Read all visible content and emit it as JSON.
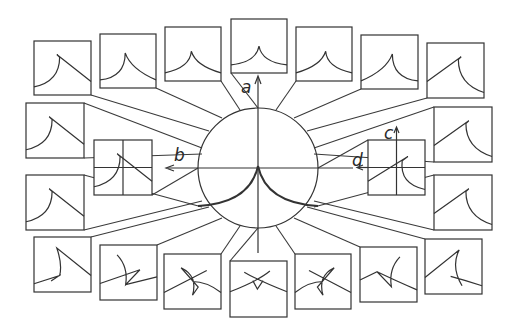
{
  "figure": {
    "stroke_color": "#333333",
    "background": "#ffffff"
  },
  "axes": {
    "a": "a",
    "b": "b",
    "c": "c",
    "d": "d"
  },
  "boxes": [
    {
      "id": "top-1",
      "x": 34,
      "y": 41,
      "w": 57,
      "h": 54,
      "curve": "cusp-left",
      "anchor": [
        209,
        131
      ]
    },
    {
      "id": "top-2",
      "x": 100,
      "y": 34,
      "w": 56,
      "h": 54,
      "curve": "cusp-left-mild",
      "anchor": [
        222,
        118
      ]
    },
    {
      "id": "top-3",
      "x": 165,
      "y": 27,
      "w": 56,
      "h": 54,
      "curve": "cusp-sym-left",
      "anchor": [
        240,
        110
      ]
    },
    {
      "id": "top-4",
      "x": 231,
      "y": 19,
      "w": 56,
      "h": 54,
      "curve": "cusp-sym",
      "anchor": [
        258,
        108
      ]
    },
    {
      "id": "top-5",
      "x": 296,
      "y": 27,
      "w": 56,
      "h": 54,
      "curve": "cusp-sym-right",
      "anchor": [
        276,
        110
      ]
    },
    {
      "id": "top-6",
      "x": 361,
      "y": 35,
      "w": 57,
      "h": 54,
      "curve": "cusp-right-mild",
      "anchor": [
        294,
        118
      ]
    },
    {
      "id": "top-7",
      "x": 427,
      "y": 43,
      "w": 57,
      "h": 55,
      "curve": "cusp-right",
      "anchor": [
        307,
        131
      ]
    },
    {
      "id": "left-upper",
      "x": 26,
      "y": 103,
      "w": 58,
      "h": 55,
      "curve": "cusp-left",
      "anchor": [
        202,
        148
      ]
    },
    {
      "id": "left-lower",
      "x": 26,
      "y": 175,
      "w": 58,
      "h": 55,
      "curve": "cusp-left",
      "anchor": [
        202,
        207
      ]
    },
    {
      "id": "right-upper",
      "x": 434,
      "y": 107,
      "w": 58,
      "h": 55,
      "curve": "cusp-right",
      "anchor": [
        314,
        148
      ]
    },
    {
      "id": "right-lower",
      "x": 434,
      "y": 175,
      "w": 58,
      "h": 55,
      "curve": "cusp-right",
      "anchor": [
        314,
        207
      ]
    },
    {
      "id": "inner-left",
      "x": 94,
      "y": 140,
      "w": 58,
      "h": 55,
      "curve": "cusp-left",
      "crosshair": true,
      "anchor": [
        198,
        168
      ]
    },
    {
      "id": "inner-right",
      "x": 368,
      "y": 140,
      "w": 57,
      "h": 55,
      "curve": "cusp-right-cross",
      "crosshair": true,
      "anchor": [
        318,
        168
      ]
    },
    {
      "id": "bottom-1",
      "x": 34,
      "y": 237,
      "w": 57,
      "h": 55,
      "curve": "swallow-left-1",
      "anchor": [
        209,
        207
      ]
    },
    {
      "id": "bottom-2",
      "x": 100,
      "y": 245,
      "w": 57,
      "h": 55,
      "curve": "swallow-left-2",
      "anchor": [
        222,
        218
      ]
    },
    {
      "id": "bottom-3",
      "x": 164,
      "y": 254,
      "w": 57,
      "h": 55,
      "curve": "star-left",
      "anchor": [
        240,
        226
      ]
    },
    {
      "id": "bottom-4",
      "x": 230,
      "y": 261,
      "w": 57,
      "h": 56,
      "curve": "star-center",
      "anchor": [
        258,
        228
      ]
    },
    {
      "id": "bottom-5",
      "x": 295,
      "y": 254,
      "w": 56,
      "h": 55,
      "curve": "star-right",
      "anchor": [
        276,
        226
      ]
    },
    {
      "id": "bottom-6",
      "x": 360,
      "y": 247,
      "w": 57,
      "h": 55,
      "curve": "swallow-right-2",
      "anchor": [
        294,
        218
      ]
    },
    {
      "id": "bottom-7",
      "x": 425,
      "y": 239,
      "w": 57,
      "h": 55,
      "curve": "swallow-right-1",
      "anchor": [
        307,
        207
      ]
    }
  ],
  "circle": {
    "cx": 258,
    "cy": 168,
    "r": 60
  }
}
